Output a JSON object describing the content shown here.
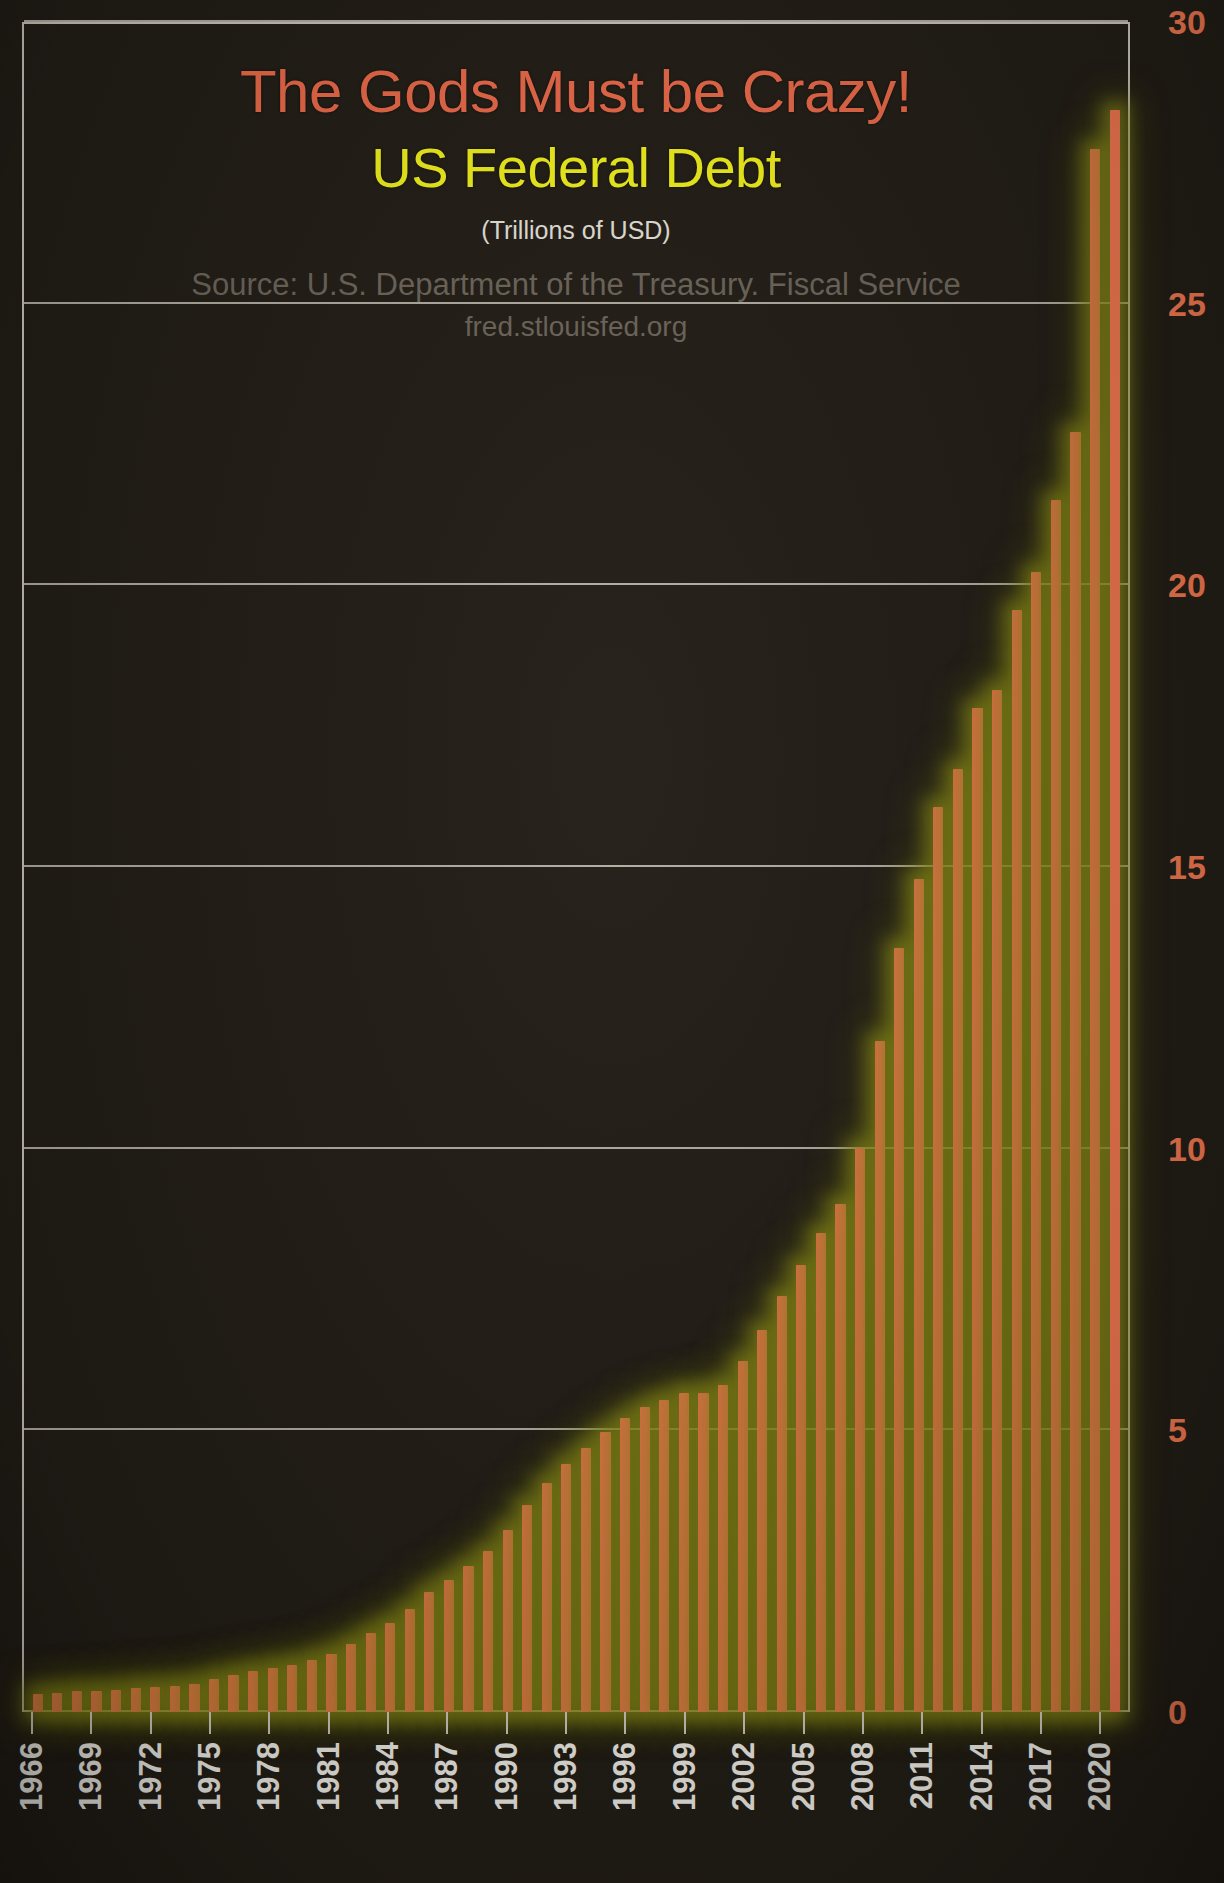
{
  "chart_data": {
    "type": "bar",
    "title": "The Gods Must be Crazy!",
    "subtitle": "US Federal Debt",
    "units": "(Trillions of USD)",
    "source": "Source: U.S. Department of the Treasury. Fiscal Service",
    "url": "fred.stlouisfed.org",
    "xlabel": "",
    "ylabel": "",
    "ylim": [
      0,
      30
    ],
    "ytick_values": [
      30,
      25,
      20,
      15,
      10,
      5,
      0
    ],
    "ytick_labels": [
      "30",
      "25",
      "20",
      "15",
      "10",
      "5",
      "0"
    ],
    "grid": true,
    "legend": null,
    "xtick_labels": [
      "1966",
      "1969",
      "1972",
      "1975",
      "1978",
      "1981",
      "1984",
      "1987",
      "1990",
      "1993",
      "1996",
      "1999",
      "2002",
      "2005",
      "2008",
      "2011",
      "2014",
      "2017",
      "2020"
    ],
    "categories": [
      "1966",
      "1967",
      "1968",
      "1969",
      "1970",
      "1971",
      "1972",
      "1973",
      "1974",
      "1975",
      "1976",
      "1977",
      "1978",
      "1979",
      "1980",
      "1981",
      "1982",
      "1983",
      "1984",
      "1985",
      "1986",
      "1987",
      "1988",
      "1989",
      "1990",
      "1991",
      "1992",
      "1993",
      "1994",
      "1995",
      "1996",
      "1997",
      "1998",
      "1999",
      "2000",
      "2001",
      "2002",
      "2003",
      "2004",
      "2005",
      "2006",
      "2007",
      "2008",
      "2009",
      "2010",
      "2011",
      "2012",
      "2013",
      "2014",
      "2015",
      "2016",
      "2017",
      "2018",
      "2019",
      "2020",
      "2021"
    ],
    "values": [
      0.32,
      0.34,
      0.37,
      0.37,
      0.39,
      0.42,
      0.45,
      0.47,
      0.49,
      0.58,
      0.65,
      0.72,
      0.78,
      0.84,
      0.93,
      1.03,
      1.2,
      1.4,
      1.58,
      1.82,
      2.13,
      2.35,
      2.6,
      2.86,
      3.23,
      3.67,
      4.06,
      4.41,
      4.69,
      4.97,
      5.22,
      5.41,
      5.53,
      5.66,
      5.67,
      5.81,
      6.23,
      6.78,
      7.38,
      7.93,
      8.51,
      9.01,
      10.02,
      11.91,
      13.56,
      14.79,
      16.07,
      16.74,
      17.82,
      18.15,
      19.57,
      20.24,
      21.52,
      22.72,
      27.75,
      28.43
    ],
    "series": [
      {
        "name": "US Federal Debt",
        "values": [
          0.32,
          0.34,
          0.37,
          0.37,
          0.39,
          0.42,
          0.45,
          0.47,
          0.49,
          0.58,
          0.65,
          0.72,
          0.78,
          0.84,
          0.93,
          1.03,
          1.2,
          1.4,
          1.58,
          1.82,
          2.13,
          2.35,
          2.6,
          2.86,
          3.23,
          3.67,
          4.06,
          4.41,
          4.69,
          4.97,
          5.22,
          5.41,
          5.53,
          5.66,
          5.67,
          5.81,
          6.23,
          6.78,
          7.38,
          7.93,
          8.51,
          9.01,
          10.02,
          11.91,
          13.56,
          14.79,
          16.07,
          16.74,
          17.82,
          18.15,
          19.57,
          20.24,
          21.52,
          22.72,
          27.75,
          28.43
        ]
      }
    ],
    "colors": {
      "bar": "#f2784f",
      "bar_glow": "#8b8b18",
      "background": "#231e17",
      "grid": "#cfc9bd",
      "title": "#ef6b4a",
      "subtitle": "#f4f41c",
      "units": "#e9e6df",
      "source": "#6e675c",
      "ytick": "#f2784f",
      "xtick": "#f2efe8"
    }
  }
}
